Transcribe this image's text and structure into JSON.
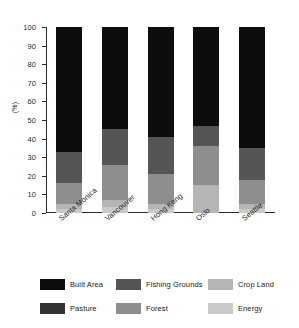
{
  "chart_data": {
    "type": "bar",
    "stacked": true,
    "title": "",
    "xlabel": "",
    "ylabel": "(%)",
    "ylim": [
      0,
      100
    ],
    "yticks": [
      0,
      10,
      20,
      30,
      40,
      50,
      60,
      70,
      80,
      90,
      100
    ],
    "grid": false,
    "legend_position": "bottom",
    "categories": [
      "Santa Monica",
      "Vancouver",
      "Hong Kong",
      "Oslo",
      "Seattle"
    ],
    "series": [
      {
        "name": "Energy",
        "color": "#c9c9c9",
        "values": [
          2,
          3,
          2,
          0,
          2
        ]
      },
      {
        "name": "Crop Land",
        "color": "#b5b5b5",
        "values": [
          3,
          4,
          3,
          15,
          3
        ]
      },
      {
        "name": "Forest",
        "color": "#8e8e8e",
        "values": [
          11,
          19,
          16,
          21,
          13
        ]
      },
      {
        "name": "Fishing Grounds",
        "color": "#555555",
        "values": [
          17,
          19,
          20,
          11,
          17
        ]
      },
      {
        "name": "Pasture",
        "color": "#333333",
        "values": [
          0,
          0,
          0,
          0,
          0
        ]
      },
      {
        "name": "Built Area",
        "color": "#0d0d0d",
        "values": [
          67,
          55,
          59,
          53,
          65
        ]
      }
    ]
  },
  "axis": {
    "y_label": "(%)",
    "y_ticks": [
      "100",
      "90",
      "80",
      "70",
      "60",
      "50",
      "40",
      "30",
      "20",
      "10",
      "0"
    ],
    "x_ticks": [
      "Santa Monica",
      "Vancouver",
      "Hong Kong",
      "Oslo",
      "Seattle"
    ]
  },
  "legend": {
    "items": [
      {
        "label": "Built Area",
        "color": "#0d0d0d"
      },
      {
        "label": "Fishing Grounds",
        "color": "#555555"
      },
      {
        "label": "Crop Land",
        "color": "#b5b5b5"
      },
      {
        "label": "Pasture",
        "color": "#333333"
      },
      {
        "label": "Forest",
        "color": "#8e8e8e"
      },
      {
        "label": "Energy",
        "color": "#c9c9c9"
      }
    ]
  }
}
